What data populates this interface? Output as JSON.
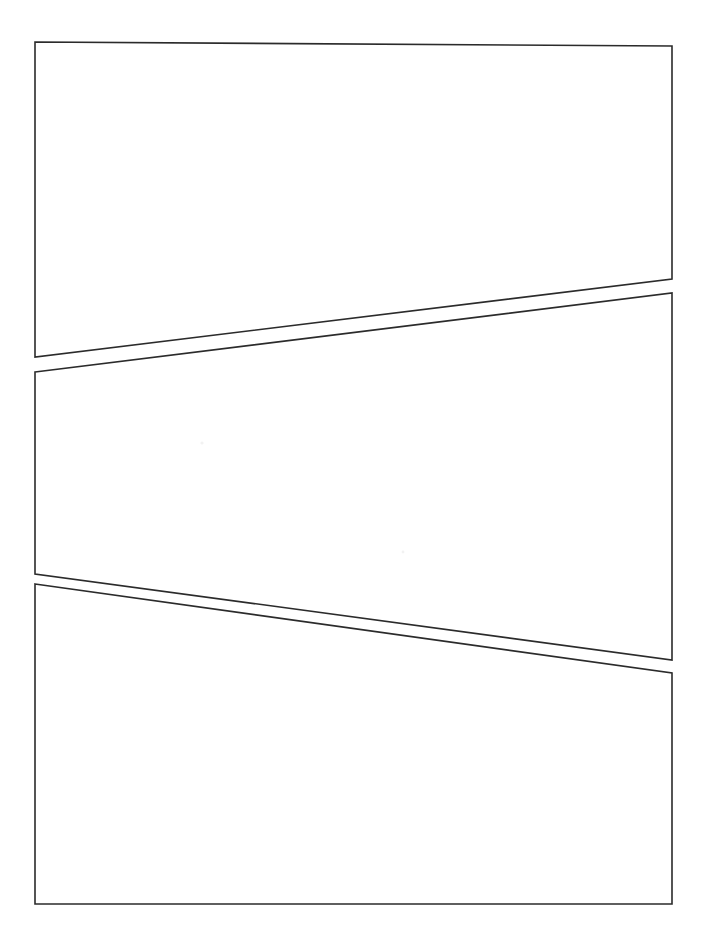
{
  "page": {
    "width": 706,
    "height": 950,
    "background_color": "#ffffff",
    "ink_color": "#2b2b2b",
    "panel_fill_color": "#ffffff",
    "stroke_width": 1.6,
    "panel_count": 3,
    "layout": "three horizontal tiers separated by slanted gutters"
  },
  "panels": [
    {
      "id": "panel-1",
      "label": "Panel 1",
      "order": 1,
      "tier": "top",
      "content": "",
      "points": "35,42 672,46 672,279 35,357",
      "corners": {
        "top_left": [
          35,
          42
        ],
        "top_right": [
          672,
          46
        ],
        "bottom_right": [
          672,
          279
        ],
        "bottom_left": [
          35,
          357
        ]
      }
    },
    {
      "id": "panel-2",
      "label": "Panel 2",
      "order": 2,
      "tier": "middle",
      "content": "",
      "points": "35,372 672,293 672,660 35,574",
      "corners": {
        "top_left": [
          35,
          372
        ],
        "top_right": [
          672,
          293
        ],
        "bottom_right": [
          672,
          660
        ],
        "bottom_left": [
          35,
          574
        ]
      }
    },
    {
      "id": "panel-3",
      "label": "Panel 3",
      "order": 3,
      "tier": "bottom",
      "content": "",
      "points": "35,584 672,673 672,904 35,904",
      "corners": {
        "top_left": [
          35,
          584
        ],
        "top_right": [
          672,
          673
        ],
        "bottom_right": [
          672,
          904
        ],
        "bottom_left": [
          35,
          904
        ]
      }
    }
  ],
  "gutters": [
    {
      "id": "gutter-1",
      "label": "Gutter between Panel 1 and Panel 2",
      "between": [
        "panel-1",
        "panel-2"
      ],
      "direction": "descends left to right on the page, slanted upward toward the right"
    },
    {
      "id": "gutter-2",
      "label": "Gutter between Panel 2 and Panel 3",
      "between": [
        "panel-2",
        "panel-3"
      ],
      "direction": "slanted downward toward the right"
    }
  ],
  "specks": [
    {
      "id": "speck-1",
      "cx": 202,
      "cy": 443,
      "r": 1.6
    },
    {
      "id": "speck-2",
      "cx": 403,
      "cy": 552,
      "r": 1.4
    }
  ]
}
